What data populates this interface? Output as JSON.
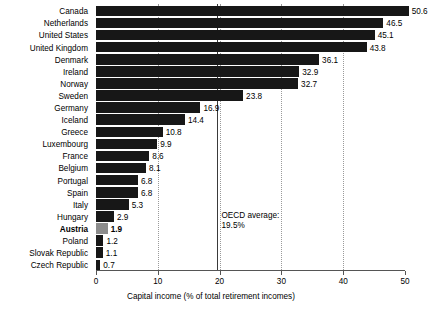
{
  "chart_data": {
    "type": "bar",
    "orientation": "horizontal",
    "title": "",
    "xlabel": "Capital income (% of total retirement incomes)",
    "ylabel": "",
    "xlim": [
      0,
      50
    ],
    "xticks": [
      0,
      10,
      20,
      30,
      40,
      50
    ],
    "xtick_labels": [
      "0",
      "10",
      "20",
      "30",
      "40",
      "50"
    ],
    "grid": "vertical-dotted",
    "legend": "none",
    "categories": [
      "Canada",
      "Netherlands",
      "United States",
      "United Kingdom",
      "Denmark",
      "Ireland",
      "Norway",
      "Sweden",
      "Germany",
      "Iceland",
      "Greece",
      "Luxembourg",
      "France",
      "Belgium",
      "Portugal",
      "Spain",
      "Italy",
      "Hungary",
      "Austria",
      "Poland",
      "Slovak Republic",
      "Czech Republic"
    ],
    "values": [
      50.6,
      46.5,
      45.1,
      43.8,
      36.1,
      32.9,
      32.7,
      23.8,
      16.9,
      14.4,
      10.8,
      9.9,
      8.6,
      8.1,
      6.8,
      6.8,
      5.3,
      2.9,
      1.9,
      1.2,
      1.1,
      0.7
    ],
    "value_labels": [
      "50.6",
      "46.5",
      "45.1",
      "43.8",
      "36.1",
      "32.9",
      "32.7",
      "23.8",
      "16.9",
      "14.4",
      "10.8",
      "9.9",
      "8.6",
      "8.1",
      "6.8",
      "6.8",
      "5.3",
      "2.9",
      "1.9",
      "1.2",
      "1.1",
      "0.7"
    ],
    "highlight_category": "Austria",
    "annotations": [
      {
        "name": "oecd-average",
        "line_1": "OECD average:",
        "line_2": "19.5%",
        "value": 19.5
      }
    ],
    "colors": {
      "bar": "#171717",
      "bar_highlight": "#8c8c8c",
      "gridline": "#9a9a9a",
      "average_line": "#3a3a3a",
      "axis": "#555555",
      "background": "#ffffff",
      "text": "#000000"
    }
  }
}
